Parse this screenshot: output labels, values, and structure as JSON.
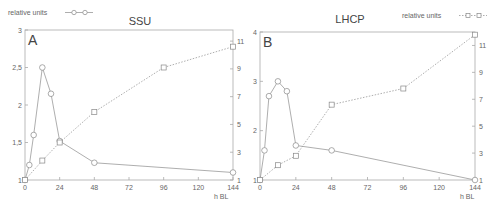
{
  "chart_data": [
    {
      "type": "line",
      "panel_label": "A",
      "title": "SSU",
      "xlabel": "h BL",
      "legend": {
        "label": "relative units",
        "marker": "circle",
        "position": "top-left"
      },
      "x_ticks": [
        0,
        24,
        48,
        72,
        96,
        120,
        144
      ],
      "xlim": [
        0,
        144
      ],
      "left_axis": {
        "ylim": [
          1,
          3
        ],
        "ticks": [
          "1",
          "1,5",
          "2",
          "2,5",
          "3"
        ],
        "tick_values": [
          1,
          1.5,
          2,
          2.5,
          3
        ]
      },
      "right_axis": {
        "ylim": [
          1,
          11.8
        ],
        "ticks": [
          "1",
          "3",
          "5",
          "7",
          "9",
          "11"
        ],
        "tick_values": [
          1,
          3,
          5,
          7,
          9,
          11
        ]
      },
      "series": [
        {
          "name": "relative units (circles, left axis)",
          "marker": "circle",
          "line": "solid",
          "axis": "left",
          "x": [
            0,
            3,
            6,
            12,
            18,
            24,
            48,
            144
          ],
          "values": [
            1.0,
            1.2,
            1.6,
            2.5,
            2.15,
            1.52,
            1.23,
            1.1
          ]
        },
        {
          "name": "squares (right axis)",
          "marker": "square",
          "line": "dotted",
          "axis": "right",
          "x": [
            0,
            12,
            24,
            48,
            96,
            144
          ],
          "values": [
            1.0,
            2.4,
            3.7,
            5.9,
            9.1,
            10.6
          ]
        }
      ],
      "grid": false
    },
    {
      "type": "line",
      "panel_label": "B",
      "title": "LHCP",
      "xlabel": "h BL",
      "legend": {
        "label": "relative units",
        "marker": "square",
        "position": "top-right"
      },
      "x_ticks": [
        0,
        24,
        48,
        72,
        96,
        120,
        144
      ],
      "xlim": [
        0,
        144
      ],
      "left_axis": {
        "ylim": [
          1,
          4
        ],
        "ticks": [
          "1",
          "2",
          "3",
          "4"
        ],
        "tick_values": [
          1,
          2,
          3,
          4
        ]
      },
      "right_axis": {
        "ylim": [
          1,
          12
        ],
        "ticks": [
          "1",
          "3",
          "5",
          "7",
          "9",
          "11"
        ],
        "tick_values": [
          1,
          3,
          5,
          7,
          9,
          11
        ]
      },
      "series": [
        {
          "name": "circles (left axis)",
          "marker": "circle",
          "line": "solid",
          "axis": "left",
          "x": [
            0,
            3,
            6,
            12,
            18,
            24,
            48,
            144
          ],
          "values": [
            1.0,
            1.6,
            2.7,
            3.0,
            2.8,
            1.7,
            1.6,
            1.0
          ]
        },
        {
          "name": "relative units (squares, right axis)",
          "marker": "square",
          "line": "dotted",
          "axis": "right",
          "x": [
            0,
            12,
            24,
            48,
            96,
            144
          ],
          "values": [
            1.0,
            2.1,
            2.8,
            6.6,
            7.8,
            11.8
          ]
        }
      ],
      "grid": false
    }
  ],
  "colors": {
    "axis": "#aaaaaa",
    "line": "#999999",
    "text": "#555555"
  }
}
